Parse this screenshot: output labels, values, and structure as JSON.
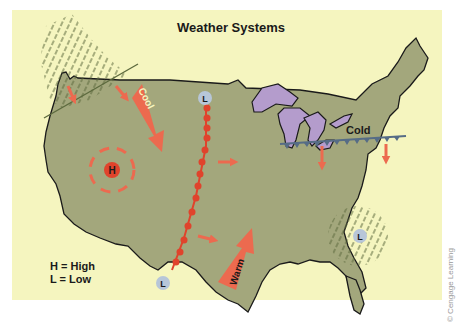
{
  "title": "Weather Systems",
  "legend": {
    "high": "H = High",
    "low": "L = Low"
  },
  "credit": "© Cengage Learning",
  "labels": {
    "high_center": "H",
    "low_north": "L",
    "low_south": "L",
    "low_east": "L",
    "cool_arrow": "Cool",
    "warm_arrow": "Warm",
    "cold_front": "Cold"
  },
  "colors": {
    "background": "#f5f5bf",
    "land": "#a3a77c",
    "lakes": "#b49ccc",
    "arrows": "#ec6a4f",
    "warm_front": "#e0432c",
    "cold_front": "#566c86",
    "low_badge": "#b7c6d8",
    "high_badge": "#e0432c",
    "precip": "#5d6a3e"
  }
}
